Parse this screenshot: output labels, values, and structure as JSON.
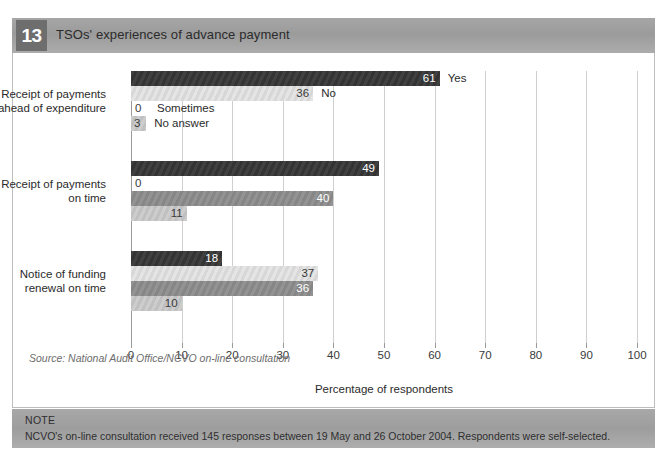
{
  "header": {
    "figure_number": "13",
    "title": "TSOs' experiences of advance payment"
  },
  "source": "Source: National Audit Office/NCVO on-line consultation",
  "note": {
    "label": "NOTE",
    "text": "NCVO's on-line consultation received 145 responses between 19 May and 26 October 2004. Respondents were self-selected."
  },
  "chart_data": {
    "type": "bar",
    "orientation": "horizontal",
    "title": "TSOs' experiences of advance payment",
    "xlabel": "Percentage of respondents",
    "ylabel": "",
    "xlim": [
      0,
      100
    ],
    "xticks": [
      0,
      10,
      20,
      30,
      40,
      50,
      60,
      70,
      80,
      90,
      100
    ],
    "xticklabels": [
      "0",
      "10",
      "20",
      "30",
      "40",
      "50",
      "60",
      "70",
      "80",
      "90",
      "100"
    ],
    "grid": "vertical",
    "legend": "inline-labels-on-first-group",
    "categories": [
      "Receipt of payments ahead of expenditure",
      "Receipt of payments on time",
      "Notice of funding renewal on time"
    ],
    "category_lines": [
      [
        "Receipt of payments",
        "ahead of expenditure"
      ],
      [
        "Receipt of payments",
        "on time"
      ],
      [
        "Notice of funding",
        "renewal on time"
      ]
    ],
    "series": [
      {
        "name": "Yes",
        "color": "#363636",
        "values": [
          61,
          49,
          18
        ]
      },
      {
        "name": "No",
        "color": "#e3e3e3",
        "values": [
          36,
          0,
          37
        ]
      },
      {
        "name": "Sometimes",
        "color": "#8d8d8d",
        "values": [
          0,
          40,
          36
        ]
      },
      {
        "name": "No answer",
        "color": "#cacaca",
        "values": [
          3,
          11,
          10
        ]
      }
    ]
  }
}
